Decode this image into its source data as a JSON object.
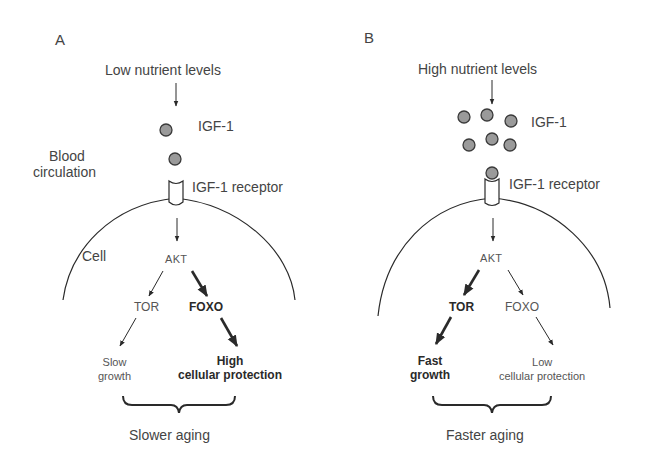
{
  "panels": [
    {
      "letter": "A",
      "nutrient": "Low nutrient levels",
      "ligand": "IGF-1",
      "blood": [
        "Blood",
        "circulation"
      ],
      "receptor": "IGF-1 receptor",
      "cell": "Cell",
      "akt": "AKT",
      "tor": "TOR",
      "foxo": "FOXO",
      "tor_emphasis": false,
      "foxo_emphasis": true,
      "left_outcome": [
        "Slow",
        "growth"
      ],
      "right_outcome": [
        "High",
        "cellular protection"
      ],
      "result": "Slower aging",
      "ligand_count": 2
    },
    {
      "letter": "B",
      "nutrient": "High nutrient levels",
      "ligand": "IGF-1",
      "receptor": "IGF-1 receptor",
      "akt": "AKT",
      "tor": "TOR",
      "foxo": "FOXO",
      "tor_emphasis": true,
      "foxo_emphasis": false,
      "left_outcome": [
        "Fast",
        "growth"
      ],
      "right_outcome": [
        "Low",
        "cellular protection"
      ],
      "result": "Faster aging",
      "ligand_count": 7
    }
  ],
  "colors": {
    "line": "#2a2a2a",
    "ligand_fill": "#9a9a9a",
    "ligand_stroke": "#3a3a3a"
  }
}
